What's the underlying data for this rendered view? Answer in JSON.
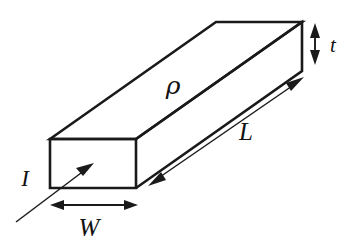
{
  "figure": {
    "shape": "rectangular-bar",
    "background_color": "#ffffff",
    "line_color": "#1a1a1a"
  },
  "labels": {
    "resistivity": {
      "text": "ρ",
      "name": "resistivity-rho",
      "x": 173,
      "y": 94
    },
    "length": {
      "text": "L",
      "name": "length-L",
      "x": 246,
      "y": 140
    },
    "width": {
      "text": "W",
      "name": "width-W",
      "x": 80,
      "y": 234
    },
    "thickness": {
      "text": "t",
      "name": "thickness-t",
      "x": 330,
      "y": 52
    },
    "current": {
      "text": "I",
      "name": "current-I",
      "x": 22,
      "y": 186
    }
  },
  "geometry": {
    "front_face": {
      "top_left": [
        50,
        139
      ],
      "top_right": [
        136,
        139
      ],
      "bottom_right": [
        136,
        188
      ],
      "bottom_left": [
        50,
        188
      ]
    },
    "back_face": {
      "top_left": [
        216,
        22
      ],
      "top_right": [
        302,
        22
      ],
      "bottom_right": [
        302,
        71
      ],
      "bottom_left": [
        216,
        71
      ]
    },
    "depth_vector": [
      166,
      -117
    ]
  },
  "dimension_arrows": {
    "length_arrow": {
      "name": "length-dimension-arrow",
      "from": [
        150,
        184
      ],
      "to": [
        302,
        78
      ],
      "heads": "both"
    },
    "width_arrow": {
      "name": "width-dimension-arrow",
      "from": [
        52,
        205
      ],
      "to": [
        136,
        205
      ],
      "heads": "both"
    },
    "thickness_arrow": {
      "name": "thickness-dimension-arrow",
      "from": [
        315,
        25
      ],
      "to": [
        315,
        63
      ],
      "heads": "both"
    },
    "current_arrow": {
      "name": "current-direction-arrow",
      "from": [
        17,
        221
      ],
      "to": [
        93,
        163
      ],
      "heads": "single"
    }
  }
}
